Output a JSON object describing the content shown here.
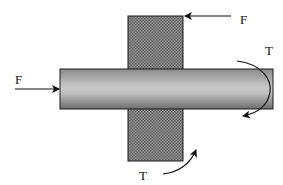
{
  "diagram": {
    "labels": {
      "force_top": "F",
      "force_left": "F",
      "torque_right": "T",
      "torque_bottom": "T"
    },
    "colors": {
      "block_fill": "#7a7a7a",
      "shaft_light": "#c4c4c4",
      "shaft_dark": "#7c7c7c",
      "stroke": "#1a1a1a"
    }
  }
}
